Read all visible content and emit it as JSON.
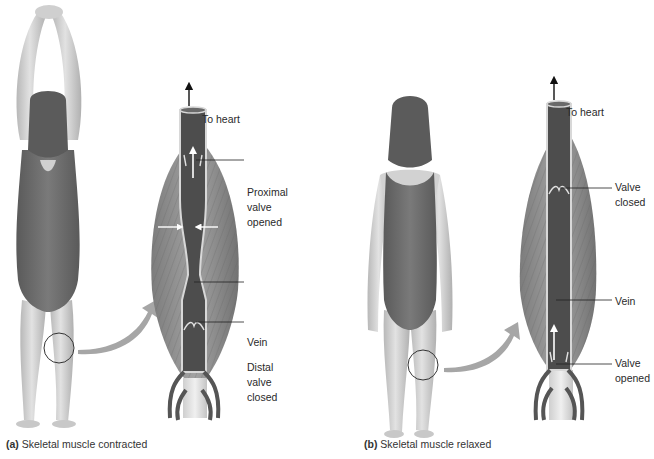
{
  "figure": {
    "panels": [
      {
        "id": "a",
        "caption_letter": "(a)",
        "caption_text": "Skeletal muscle contracted",
        "labels": {
          "to_heart": "To heart",
          "upper_valve": "Proximal\nvalve\nopened",
          "vein": "Vein",
          "lower_valve": "Distal\nvalve\nclosed"
        }
      },
      {
        "id": "b",
        "caption_letter": "(b)",
        "caption_text": "Skeletal muscle relaxed",
        "labels": {
          "to_heart": "To heart",
          "upper_valve": "Valve\nclosed",
          "vein": "Vein",
          "lower_valve": "Valve\nopened"
        }
      }
    ],
    "colors": {
      "skin": "#d4d4d4",
      "skin_shadow": "#a9a9a9",
      "swimsuit": "#6e6e6e",
      "hair": "#595959",
      "muscle": "#8f8f8f",
      "muscle_dark": "#6a6a6a",
      "vein": "#4a4a4a",
      "vein_wall": "#cfcfcf",
      "big_arrow": "#a6a6a6",
      "leader_line": "#222222"
    }
  }
}
